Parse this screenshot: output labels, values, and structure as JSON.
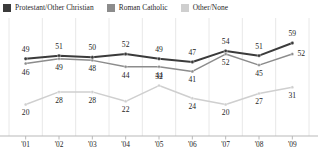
{
  "legend": {
    "items": [
      {
        "label": "Protestant/Other Christian",
        "color": "#3b3b3b",
        "swatch_name": "legend-swatch-protestant"
      },
      {
        "label": "Roman Catholic",
        "color": "#8c8c8c",
        "swatch_name": "legend-swatch-catholic"
      },
      {
        "label": "Other/None",
        "color": "#cfcfcf",
        "swatch_name": "legend-swatch-other"
      }
    ]
  },
  "chart_data": {
    "type": "line",
    "title": "",
    "xlabel": "",
    "ylabel": "",
    "grid": "vertical",
    "legend_position": "top-left",
    "categories": [
      "'01",
      "'02",
      "'03",
      "'04",
      "'05",
      "'06",
      "'07",
      "'08",
      "'09"
    ],
    "ylim": [
      0,
      66
    ],
    "series": [
      {
        "name": "Protestant/Other Christian",
        "color": "#3b3b3b",
        "values": [
          49,
          51,
          50,
          52,
          49,
          47,
          54,
          51,
          59
        ],
        "label_positions": [
          "above",
          "above",
          "above",
          "above",
          "above",
          "above",
          "above",
          "above",
          "above"
        ]
      },
      {
        "name": "Roman Catholic",
        "color": "#8c8c8c",
        "values": [
          46,
          49,
          48,
          44,
          44,
          41,
          52,
          45,
          52
        ],
        "label_positions": [
          "below",
          "below",
          "below",
          "below",
          "below",
          "below",
          "below",
          "below",
          "right"
        ]
      },
      {
        "name": "Other/None",
        "color": "#cfcfcf",
        "values": [
          20,
          28,
          28,
          22,
          32,
          24,
          20,
          27,
          31
        ],
        "label_positions": [
          "below",
          "below",
          "below",
          "below",
          "above",
          "below",
          "below",
          "below",
          "below"
        ]
      }
    ]
  }
}
